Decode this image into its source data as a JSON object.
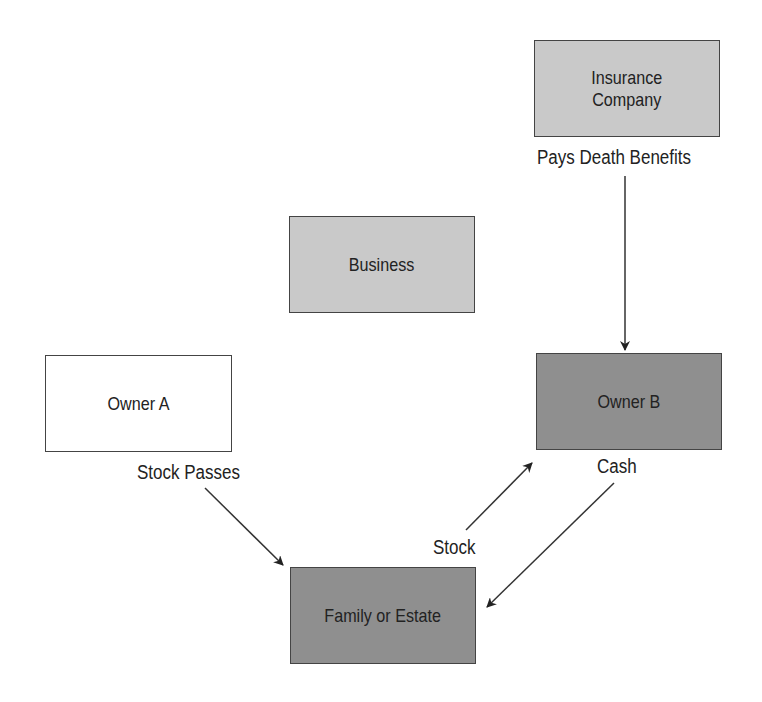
{
  "diagram": {
    "nodes": {
      "insurance": {
        "label": "Insurance\nCompany",
        "fill": "#c9c9c9"
      },
      "business": {
        "label": "Business",
        "fill": "#c9c9c9"
      },
      "owner_a": {
        "label": "Owner A",
        "fill": "#ffffff"
      },
      "owner_b": {
        "label": "Owner B",
        "fill": "#8f8f8f"
      },
      "family": {
        "label": "Family or Estate",
        "fill": "#8f8f8f"
      }
    },
    "edge_labels": {
      "pays_death_benefits": "Pays Death Benefits",
      "stock_passes": "Stock Passes",
      "cash": "Cash",
      "stock": "Stock"
    },
    "edges": [
      {
        "from": "Insurance Company",
        "to": "Owner B",
        "label": "Pays Death Benefits"
      },
      {
        "from": "Owner A",
        "to": "Family or Estate",
        "label": "Stock Passes"
      },
      {
        "from": "Family or Estate",
        "to": "Owner B",
        "label": "Stock"
      },
      {
        "from": "Owner B",
        "to": "Family or Estate",
        "label": "Cash"
      }
    ]
  }
}
